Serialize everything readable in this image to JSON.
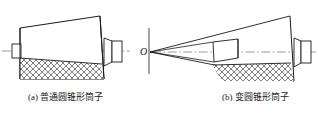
{
  "figure": {
    "title": "",
    "type": "engineering-cross-section-drawing",
    "background_color": "#ffffff",
    "line_color": "#1a1a1a",
    "hatch_color": "#555555",
    "centerline_color": "#777777",
    "panels": [
      {
        "id": "a",
        "caption": "(a) 普通圆锥形筒子",
        "label_prefix": "(a)",
        "description_text": "普通圆锥形筒子",
        "apex_label": "",
        "has_apex_marker": false
      },
      {
        "id": "b",
        "caption": "(b) 变圆锥形筒子",
        "label_prefix": "(b)",
        "description_text": "变圆锥形筒子",
        "apex_label": "O",
        "has_apex_marker": true
      }
    ],
    "annotations": {
      "apex_point_label": "O"
    }
  }
}
